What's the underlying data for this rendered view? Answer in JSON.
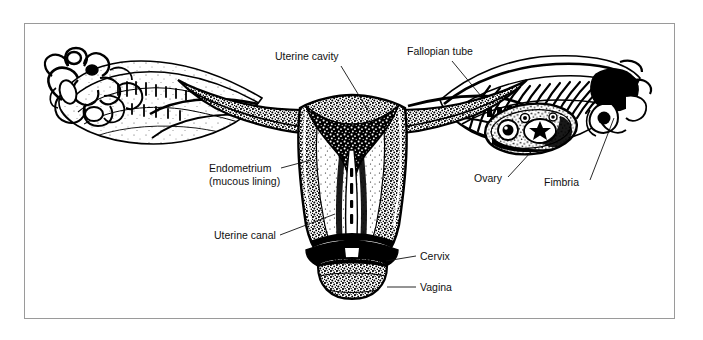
{
  "figure": {
    "background_color": "#ffffff",
    "frame_color": "#9a9a9a",
    "ink_color": "#000000",
    "labels": [
      {
        "id": "uterine-cavity",
        "text": "Uterine cavity",
        "x": 275,
        "y": 60,
        "anchor": "start"
      },
      {
        "id": "fallopian-tube",
        "text": "Fallopian tube",
        "x": 407,
        "y": 55,
        "anchor": "start"
      },
      {
        "id": "endometrium",
        "text": "Endometrium",
        "x": 209,
        "y": 172,
        "anchor": "start"
      },
      {
        "id": "mucous-lining",
        "text": "(mucous lining)",
        "x": 209,
        "y": 185,
        "anchor": "start"
      },
      {
        "id": "uterine-canal",
        "text": "Uterine canal",
        "x": 214,
        "y": 239,
        "anchor": "start"
      },
      {
        "id": "ovary",
        "text": "Ovary",
        "x": 474,
        "y": 182,
        "anchor": "start"
      },
      {
        "id": "fimbria",
        "text": "Fimbria",
        "x": 544,
        "y": 186,
        "anchor": "start"
      },
      {
        "id": "cervix",
        "text": "Cervix",
        "x": 420,
        "y": 260,
        "anchor": "start"
      },
      {
        "id": "vagina",
        "text": "Vagina",
        "x": 420,
        "y": 291,
        "anchor": "start"
      }
    ],
    "leaders": [
      {
        "id": "leader-uterine-cavity",
        "points": "341,66 369,112"
      },
      {
        "id": "leader-fallopian-tube",
        "points": "452,61 481,96"
      },
      {
        "id": "leader-endometrium",
        "points": "281,168 309,160"
      },
      {
        "id": "leader-uterine-canal",
        "points": "280,235 334,216"
      },
      {
        "id": "leader-ovary",
        "points": "508,177 531,152"
      },
      {
        "id": "leader-fimbria",
        "points": "590,180 614,118"
      },
      {
        "id": "leader-cervix",
        "points": "416,256 386,262"
      },
      {
        "id": "leader-vagina",
        "points": "416,287 387,287"
      }
    ]
  }
}
